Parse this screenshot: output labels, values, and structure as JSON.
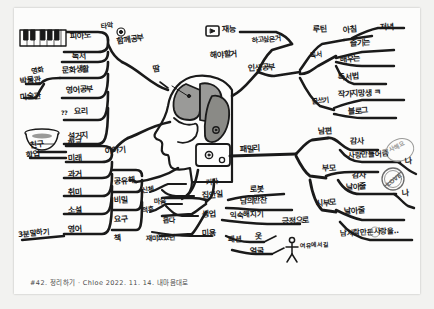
{
  "document": {
    "type": "hand-drawn-mindmap",
    "medium": "pen on paper photo",
    "center_topic": "머리 / 뇌 (head & brain illustration)",
    "caption": "#42. 정리하기 · Chloe 2022. 11. 14.  내마음대로"
  },
  "icons": {
    "piano": "piano-keyboard-icon",
    "bowl": "cooking-bowl-icon",
    "play": "play-button-icon",
    "circle_smiley": "smiley-circle-icon",
    "stick_figure": "stick-figure-icon",
    "love_stamp": "LOVE",
    "corner_stamp": "감사해요"
  },
  "center": {
    "label_head": "머리",
    "label_drop": "땀",
    "brain_front": "brain-front-lobe",
    "brain_back": "brain-back-lobe",
    "jaw_box": "jaw-panel"
  },
  "left_branches": {
    "trunk_top_label": "함께공부",
    "trunk_mid_label": "이야기",
    "trunk_bottom_label": "공유해",
    "column_a": [
      {
        "label": "타악",
        "note": "circle-icon"
      },
      {
        "label": "피아노"
      },
      {
        "label": "독서"
      },
      {
        "label": "문화생활"
      },
      {
        "label": "영어공부"
      },
      {
        "label": "요리",
        "prefix": "??"
      },
      {
        "label": "설거지"
      }
    ],
    "column_a_side": [
      {
        "label": "영화"
      },
      {
        "label": "박물관"
      },
      {
        "label": "미술관"
      }
    ],
    "column_b": [
      {
        "label": "학교"
      },
      {
        "label": "미래"
      },
      {
        "label": "과거"
      },
      {
        "label": "취미"
      },
      {
        "label": "소설"
      },
      {
        "label": "영어"
      }
    ],
    "column_b_side": [
      {
        "label": "친구"
      },
      {
        "label": "학업"
      },
      {
        "label": "3분말하기"
      }
    ],
    "column_c": [
      {
        "label": "공유해"
      },
      {
        "label": "비밀"
      },
      {
        "label": "요구"
      },
      {
        "label": "책"
      }
    ],
    "column_c_side": [
      {
        "label": "신체"
      },
      {
        "label": "마음"
      },
      {
        "label": "적후"
      },
      {
        "label": "돕다"
      },
      {
        "label": "재미있었던"
      }
    ]
  },
  "right_branches": {
    "top_trunk": [
      {
        "label": "재능"
      },
      {
        "label": "하고싶은거"
      },
      {
        "label": "해야할거"
      },
      {
        "label": "인생공부"
      }
    ],
    "reading": [
      {
        "label": "루틴"
      },
      {
        "label": "아침"
      },
      {
        "label": "저녁"
      },
      {
        "label": "독서"
      },
      {
        "label": "즐기는"
      },
      {
        "label": "배우는"
      },
      {
        "label": "독서법"
      },
      {
        "label": "글쓰기"
      },
      {
        "label": "작가지망생 ㅋ"
      },
      {
        "label": "블로그"
      }
    ],
    "family": [
      {
        "label": "패밀리"
      },
      {
        "label": "남편"
      },
      {
        "label": "감사"
      },
      {
        "label": "사랑만들어줌"
      },
      {
        "label": "나"
      },
      {
        "label": "부모"
      },
      {
        "label": "감사"
      },
      {
        "label": "날아줄"
      },
      {
        "label": "나"
      },
      {
        "label": "시부모"
      },
      {
        "label": "날아줄"
      },
      {
        "label": "남사람만든사랑을.."
      }
    ]
  },
  "bottom_branches": {
    "trunk_label": "기타",
    "items": [
      {
        "label": "집안일"
      },
      {
        "label": "로봇"
      },
      {
        "label": "남의반찬"
      },
      {
        "label": "생업"
      },
      {
        "label": "익숙해지기"
      },
      {
        "label": "긍정으로"
      },
      {
        "label": "미용"
      },
      {
        "label": "패션"
      },
      {
        "label": "옷"
      },
      {
        "label": "얼굴"
      },
      {
        "label": "여유에서길"
      }
    ]
  },
  "colors": {
    "ink": "#1a1a1a",
    "paper": "#fcfcfb",
    "backdrop": "#f2f2f0",
    "brain_fill": "#9a9a98",
    "brain_fill_dark": "#8a8a86"
  }
}
